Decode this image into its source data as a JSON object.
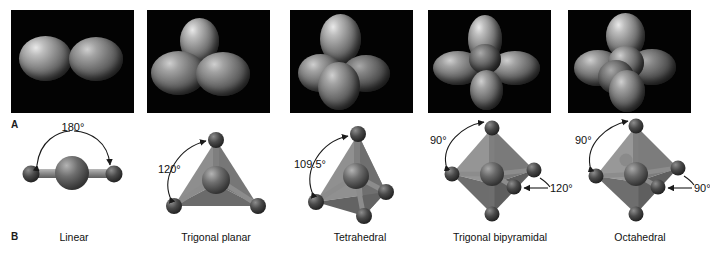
{
  "figure": {
    "rows": [
      {
        "letter": "A",
        "description": "balloon models of electron-domain geometries"
      },
      {
        "letter": "B",
        "description": "ball-and-stick geometric models with bond angles"
      }
    ]
  },
  "panels": [
    {
      "id": "linear",
      "caption": "Linear",
      "balloon_count": 2,
      "angles": [
        "180°"
      ],
      "photo": {
        "x": 11,
        "width": 123
      },
      "model": {
        "x": 4,
        "width": 140
      }
    },
    {
      "id": "trigonal-planar",
      "caption": "Trigonal planar",
      "balloon_count": 3,
      "angles": [
        "120°"
      ],
      "photo": {
        "x": 147,
        "width": 123
      },
      "model": {
        "x": 146,
        "width": 140
      }
    },
    {
      "id": "tetrahedral",
      "caption": "Tetrahedral",
      "balloon_count": 4,
      "angles": [
        "109.5°"
      ],
      "photo": {
        "x": 290,
        "width": 123
      },
      "model": {
        "x": 290,
        "width": 140
      }
    },
    {
      "id": "trigonal-bipyramidal",
      "caption": "Trigonal bipyramidal",
      "balloon_count": 5,
      "angles": [
        "90°",
        "120°"
      ],
      "photo": {
        "x": 428,
        "width": 123
      },
      "model": {
        "x": 420,
        "width": 160
      }
    },
    {
      "id": "octahedral",
      "caption": "Octahedral",
      "balloon_count": 6,
      "angles": [
        "90°",
        "90°"
      ],
      "photo": {
        "x": 568,
        "width": 123
      },
      "model": {
        "x": 570,
        "width": 140
      }
    }
  ],
  "colors": {
    "photo_background": "#030303",
    "page_background": "#ffffff",
    "central_atom": "#5a5a5a",
    "terminal_atom": "#3c3c3c",
    "bond": "#8a8a8a",
    "face_light": "#9a9a9a",
    "face_mid": "#7d7d7d",
    "face_dark": "#626262",
    "annotation": "#111111"
  }
}
